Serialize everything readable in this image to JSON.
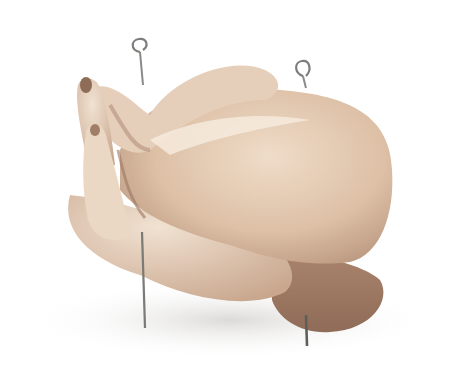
{
  "image": {
    "subject": "raw whole chicken trussed with two metal skewers",
    "alt": "Raw trussed chicken with two looped metal skewers on a white background",
    "background_color": "#ffffff",
    "colors": {
      "skin_light": "#efdcc8",
      "skin_mid": "#ddc0a6",
      "skin_shadow": "#b8957c",
      "skin_dark": "#8f6c58",
      "skewer": "#8a8a86",
      "shadow": "#e4e2e0"
    },
    "skewers": [
      {
        "loop_x": 140,
        "loop_y": 48,
        "bottom_x": 144,
        "bottom_y": 328
      },
      {
        "loop_x": 303,
        "loop_y": 68,
        "bottom_x": 307,
        "bottom_y": 345
      }
    ]
  }
}
